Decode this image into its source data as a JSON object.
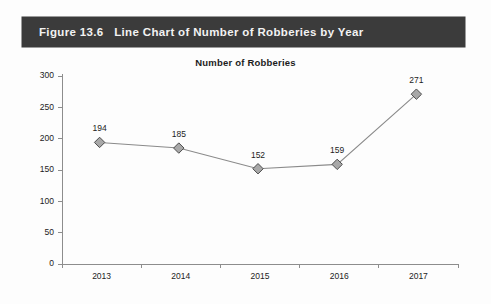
{
  "banner": {
    "caption": "Figure 13.6   Line Chart of Number of Robberies by Year",
    "background_color": "#3b3b3b",
    "text_color": "#f2f2f2"
  },
  "chart_data": {
    "type": "line",
    "title": "Number of Robberies",
    "xlabel": "",
    "ylabel": "",
    "categories": [
      "2013",
      "2014",
      "2015",
      "2016",
      "2017"
    ],
    "values": [
      194,
      185,
      152,
      159,
      271
    ],
    "point_labels": [
      "194",
      "185",
      "152",
      "159",
      "271"
    ],
    "ylim": [
      0,
      300
    ],
    "ytick_labels": [
      "0",
      "50",
      "100",
      "150",
      "200",
      "250",
      "300"
    ],
    "ytick_values": [
      0,
      50,
      100,
      150,
      200,
      250,
      300
    ],
    "grid": false,
    "legend": false,
    "marker": "diamond",
    "marker_fill_color": "#a8a8a8",
    "marker_edge_color": "#4d4d4d",
    "line_color": "#8a8a8a",
    "axis_color": "#8d8d8d"
  }
}
